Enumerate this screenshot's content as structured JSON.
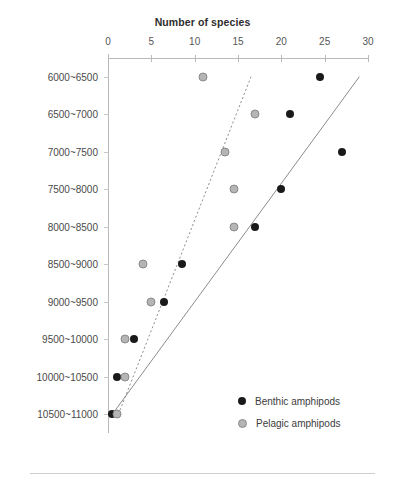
{
  "chart_data": {
    "type": "scatter",
    "title": "Number of species",
    "xlabel": "Number of species",
    "ylabel": "",
    "xlim": [
      0,
      30
    ],
    "xticks": [
      0,
      5,
      10,
      15,
      20,
      25,
      30
    ],
    "xtick_labels": [
      "0",
      "5",
      "10",
      "15",
      "20",
      "25",
      "30"
    ],
    "grid": false,
    "legend_position": "lower-right",
    "categories": [
      "6000~6500",
      "6500~7000",
      "7000~7500",
      "7500~8000",
      "8000~8500",
      "8500~9000",
      "9000~9500",
      "9500~10000",
      "10000~10500",
      "10500~11000"
    ],
    "series": [
      {
        "name": "Benthic amphipods",
        "marker": "filled-circle",
        "color": "#1a1a1a",
        "values": [
          24.5,
          21,
          27,
          20,
          17,
          8.5,
          6.5,
          3,
          1,
          0.5
        ],
        "trendline": {
          "style": "solid",
          "color": "#8c8c8c",
          "x_start": 0.5,
          "y_start": "10500~11000",
          "x_end": 29,
          "y_end": "6000~6500"
        }
      },
      {
        "name": "Pelagic amphipods",
        "marker": "open-gray-circle",
        "color": "#b5b5b5",
        "values": [
          11,
          17,
          13.5,
          14.5,
          14.5,
          4,
          5,
          2,
          2,
          1
        ],
        "trendline": {
          "style": "dotted",
          "color": "#8c8c8c",
          "x_start": 1.2,
          "y_start": "10500~11000",
          "x_end": 16.5,
          "y_end": "6000~6500"
        }
      }
    ]
  },
  "legend": {
    "items": [
      {
        "label": "Benthic amphipods",
        "marker": "filled-circle"
      },
      {
        "label": "Pelagic amphipods",
        "marker": "open-gray-circle"
      }
    ]
  }
}
